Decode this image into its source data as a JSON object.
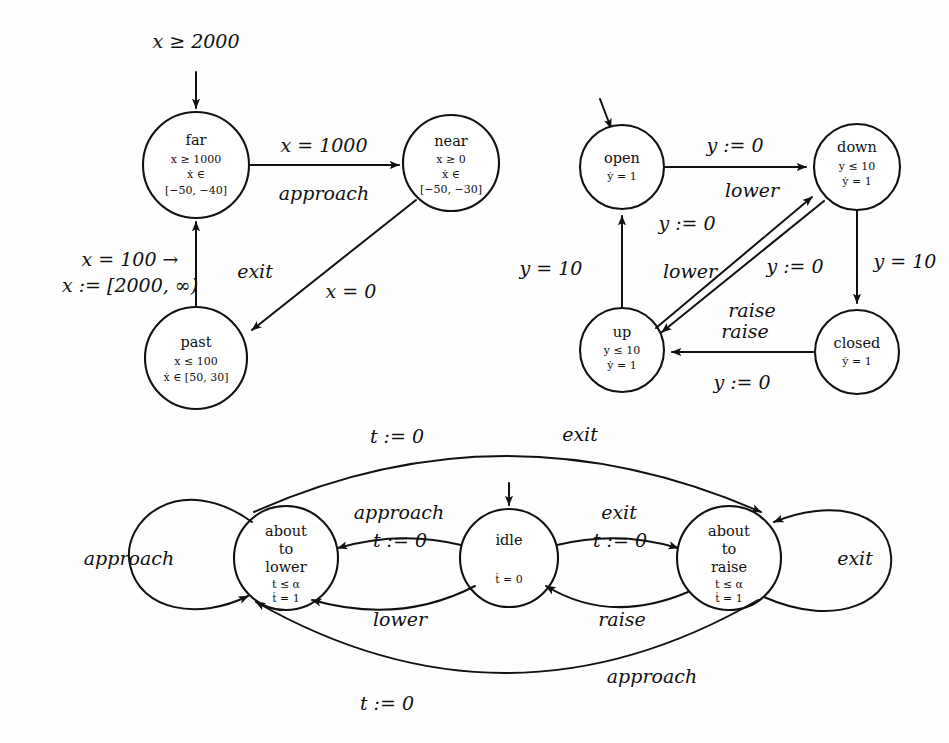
{
  "figure": {
    "background_color": "#fefefe",
    "ink_color": "#111111"
  },
  "automata": [
    {
      "id": "train",
      "name": "train-automaton",
      "nodes": [
        {
          "id": "far",
          "label": "far",
          "invariants": [
            "x ≥ 1000",
            "ẋ ∈",
            "[−50, −40]"
          ],
          "cx": 196,
          "cy": 165,
          "r": 53
        },
        {
          "id": "near",
          "label": "near",
          "invariants": [
            "x ≥ 0",
            "ẋ ∈",
            "[−50, −30]"
          ],
          "cx": 451,
          "cy": 163,
          "r": 48
        },
        {
          "id": "past",
          "label": "past",
          "invariants": [
            "x ≤ 100",
            "ẋ ∈ [50, 30]"
          ],
          "cx": 196,
          "cy": 358,
          "r": 51
        }
      ],
      "initial_label": "x ≥ 2000",
      "edges": [
        {
          "from": "far",
          "to": "near",
          "guard": "x = 1000",
          "event": "approach"
        },
        {
          "from": "near",
          "to": "past",
          "guard": "x = 0",
          "event": ""
        },
        {
          "from": "past",
          "to": "far",
          "guard_line1": "x = 100 →",
          "guard_line2": "x := [2000, ∞)",
          "event": "exit"
        }
      ]
    },
    {
      "id": "gate",
      "name": "gate-automaton",
      "nodes": [
        {
          "id": "open",
          "label": "open",
          "invariants": [
            "ẏ = 1"
          ],
          "cx": 622,
          "cy": 167,
          "r": 42
        },
        {
          "id": "down",
          "label": "down",
          "invariants": [
            "y ≤ 10",
            "ẏ = 1"
          ],
          "cx": 857,
          "cy": 167,
          "r": 43
        },
        {
          "id": "up",
          "label": "up",
          "invariants": [
            "y ≤ 10",
            "ẏ = 1"
          ],
          "cx": 622,
          "cy": 350,
          "r": 42
        },
        {
          "id": "closed",
          "label": "closed",
          "invariants": [
            "ẏ = 1"
          ],
          "cx": 857,
          "cy": 352,
          "r": 42
        }
      ],
      "edges": [
        {
          "from": "open",
          "to": "down",
          "guard": "y := 0",
          "event": "lower"
        },
        {
          "from": "down",
          "to": "closed",
          "guard": "y = 10",
          "event": ""
        },
        {
          "from": "closed",
          "to": "up",
          "guard": "y := 0",
          "event": "raise"
        },
        {
          "from": "up",
          "to": "open",
          "guard": "y = 10",
          "event": ""
        },
        {
          "from": "up",
          "to": "down",
          "guard": "y := 0",
          "event": "lower"
        },
        {
          "from": "down",
          "to": "up",
          "guard": "y := 0",
          "event": "raise"
        }
      ]
    },
    {
      "id": "controller",
      "name": "controller-automaton",
      "nodes": [
        {
          "id": "about_to_lower",
          "label_lines": [
            "about",
            "to",
            "lower"
          ],
          "invariants": [
            "t ≤ α",
            "ṫ = 1"
          ],
          "cx": 286,
          "cy": 558,
          "r": 52
        },
        {
          "id": "idle",
          "label_lines": [
            "idle"
          ],
          "invariants": [
            "ṫ = 0"
          ],
          "cx": 509,
          "cy": 558,
          "r": 49
        },
        {
          "id": "about_to_raise",
          "label_lines": [
            "about",
            "to",
            "raise"
          ],
          "invariants": [
            "t ≤ α",
            "ṫ = 1"
          ],
          "cx": 729,
          "cy": 558,
          "r": 52
        }
      ],
      "edges": [
        {
          "from": "idle",
          "to": "about_to_lower",
          "event": "approach",
          "guard": "t := 0"
        },
        {
          "from": "idle",
          "to": "about_to_raise",
          "event": "exit",
          "guard": "t := 0"
        },
        {
          "from": "about_to_lower",
          "to": "idle",
          "event": "lower",
          "guard": ""
        },
        {
          "from": "about_to_raise",
          "to": "idle",
          "event": "raise",
          "guard": ""
        },
        {
          "from": "about_to_lower",
          "to": "about_to_raise",
          "event": "exit",
          "guard": "t := 0"
        },
        {
          "from": "about_to_raise",
          "to": "about_to_lower",
          "event": "approach",
          "guard": "t := 0"
        },
        {
          "from": "about_to_lower",
          "to": "about_to_lower",
          "event": "approach",
          "guard": ""
        },
        {
          "from": "about_to_raise",
          "to": "about_to_raise",
          "event": "exit",
          "guard": ""
        }
      ]
    }
  ],
  "labels": {
    "train_initial": "x ≥ 2000",
    "train_far_name": "far",
    "train_far_inv1": "x ≥ 1000",
    "train_far_inv2": "ẋ ∈",
    "train_far_inv3": "[−50, −40]",
    "train_near_name": "near",
    "train_near_inv1": "x ≥ 0",
    "train_near_inv2": "ẋ ∈",
    "train_near_inv3": "[−50, −30]",
    "train_past_name": "past",
    "train_past_inv1": "x ≤ 100",
    "train_past_inv2": "ẋ ∈ [50, 30]",
    "train_e1_guard": "x = 1000",
    "train_e1_event": "approach",
    "train_e2_guard": "x = 0",
    "train_e3_guard1": "x = 100 →",
    "train_e3_guard2": "x := [2000, ∞)",
    "train_e3_event": "exit",
    "gate_open_name": "open",
    "gate_open_inv": "ẏ = 1",
    "gate_down_name": "down",
    "gate_down_inv1": "y ≤ 10",
    "gate_down_inv2": "ẏ = 1",
    "gate_up_name": "up",
    "gate_up_inv1": "y ≤ 10",
    "gate_up_inv2": "ẏ = 1",
    "gate_closed_name": "closed",
    "gate_closed_inv": "ẏ = 1",
    "gate_od_guard": "y := 0",
    "gate_od_event": "lower",
    "gate_dc_guard": "y = 10",
    "gate_cu_guard": "y := 0",
    "gate_cu_event": "raise",
    "gate_uo_guard": "y = 10",
    "gate_ud_guard": "y := 0",
    "gate_ud_event": "lower",
    "gate_du_guard": "y := 0",
    "gate_du_event": "raise",
    "ctrl_atl_l1": "about",
    "ctrl_atl_l2": "to",
    "ctrl_atl_l3": "lower",
    "ctrl_atl_inv1": "t ≤ α",
    "ctrl_atl_inv2": "ṫ = 1",
    "ctrl_idle_name": "idle",
    "ctrl_idle_inv": "ṫ = 0",
    "ctrl_atr_l1": "about",
    "ctrl_atr_l2": "to",
    "ctrl_atr_l3": "raise",
    "ctrl_atr_inv1": "t ≤ α",
    "ctrl_atr_inv2": "ṫ = 1",
    "ctrl_top_guard": "t := 0",
    "ctrl_top_event": "exit",
    "ctrl_bottom_guard": "t := 0",
    "ctrl_bottom_event": "approach",
    "ctrl_il_event": "approach",
    "ctrl_il_guard": "t := 0",
    "ctrl_ir_event": "exit",
    "ctrl_ir_guard": "t := 0",
    "ctrl_li_event": "lower",
    "ctrl_ri_event": "raise",
    "ctrl_loop_left": "approach",
    "ctrl_loop_right": "exit"
  }
}
